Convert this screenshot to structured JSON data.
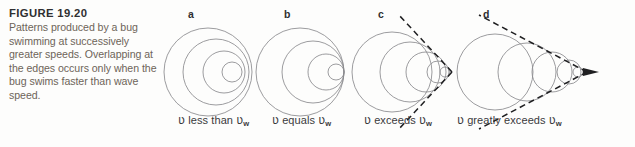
{
  "figure": {
    "number_label": "FIGURE 19.20",
    "caption": "Patterns produced by a bug swimming at successively greater speeds. Overlapping at the edges occurs only when the bug swims faster than wave speed.",
    "background_color": "#fdfdfc",
    "wave_stroke_color": "#8a8a8e",
    "cone_stroke_color": "#1f1f21",
    "caption_text_color": "#6d6459",
    "heading_text_color": "#2f2f31"
  },
  "panels": [
    {
      "letter": "a",
      "caption_prefix": "",
      "speed_symbol": "ʋ",
      "relation": "less than",
      "wave_symbol": "ʋ",
      "wave_subscript": "w",
      "caption_full": "ʋ less than ʋw",
      "letter_x": 28,
      "caption_x": 18,
      "description": "concentric circles, source moving slowly",
      "circles": [
        {
          "cx": 48,
          "cy": 56,
          "r": 44
        },
        {
          "cx": 56,
          "cy": 56,
          "r": 33
        },
        {
          "cx": 64,
          "cy": 56,
          "r": 21
        },
        {
          "cx": 72,
          "cy": 56,
          "r": 10
        }
      ]
    },
    {
      "letter": "b",
      "speed_symbol": "ʋ",
      "relation": "equals",
      "wave_symbol": "ʋ",
      "wave_subscript": "w",
      "caption_full": "ʋ equals ʋw",
      "letter_x": 28,
      "caption_x": 16,
      "description": "circles tangent at a single point, source at wave speed",
      "circles": [
        {
          "cx": 44,
          "cy": 56,
          "r": 44
        },
        {
          "cx": 57,
          "cy": 56,
          "r": 31
        },
        {
          "cx": 70,
          "cy": 56,
          "r": 18
        },
        {
          "cx": 80,
          "cy": 56,
          "r": 8
        }
      ],
      "tangent_point": {
        "x": 88,
        "y": 56
      }
    },
    {
      "letter": "c",
      "speed_symbol": "ʋ",
      "relation": "exceeds",
      "wave_symbol": "ʋ",
      "wave_subscript": "w",
      "caption_full": "ʋ exceeds ʋw",
      "letter_x": 22,
      "caption_x": 8,
      "description": "overlapping circles forming a wide V-shaped shock cone",
      "circles": [
        {
          "cx": 36,
          "cy": 56,
          "r": 40
        },
        {
          "cx": 54,
          "cy": 56,
          "r": 30
        },
        {
          "cx": 70,
          "cy": 56,
          "r": 20
        },
        {
          "cx": 82,
          "cy": 56,
          "r": 11
        },
        {
          "cx": 89,
          "cy": 56,
          "r": 5
        }
      ],
      "apex": {
        "x": 96,
        "y": 56
      },
      "cone_half_angle_deg": 46,
      "cone_line_length": 78
    },
    {
      "letter": "d",
      "speed_symbol": "ʋ",
      "relation": "greatly exceeds",
      "wave_symbol": "ʋ",
      "wave_subscript": "w",
      "caption_full": "ʋ greatly exceeds ʋw",
      "letter_x": 18,
      "caption_x": -8,
      "description": "widely separated circles forming a narrow shock cone with arrow at apex",
      "circles": [
        {
          "cx": 30,
          "cy": 56,
          "r": 38
        },
        {
          "cx": 62,
          "cy": 56,
          "r": 29
        },
        {
          "cx": 87,
          "cy": 56,
          "r": 20
        },
        {
          "cx": 104,
          "cy": 56,
          "r": 12
        },
        {
          "cx": 113,
          "cy": 56,
          "r": 5
        }
      ],
      "apex": {
        "x": 120,
        "y": 56
      },
      "cone_half_angle_deg": 27,
      "cone_line_length": 122,
      "has_arrowhead": true
    }
  ]
}
